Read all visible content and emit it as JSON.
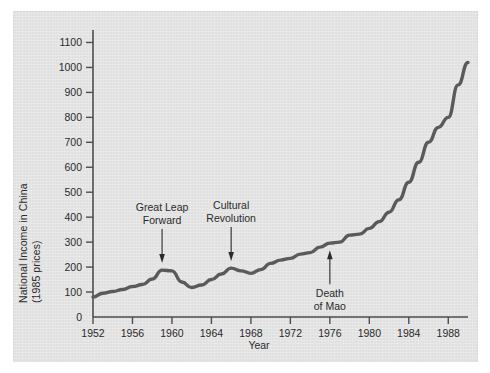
{
  "figure": {
    "background_color": "#e4e4e4",
    "line_color": "#5a5a5a",
    "axis_color": "#4d4d4d"
  },
  "chart_data": {
    "type": "line",
    "title": "",
    "xlabel": "Year",
    "ylabel_line1": "National Income in China",
    "ylabel_line2": "(1985 prices)",
    "xlim": [
      1952,
      1990
    ],
    "ylim": [
      0,
      1150
    ],
    "grid": false,
    "legend": "none",
    "xticks": [
      1952,
      1956,
      1960,
      1964,
      1968,
      1972,
      1976,
      1980,
      1984,
      1988
    ],
    "yticks": [
      0,
      100,
      200,
      300,
      400,
      500,
      600,
      700,
      800,
      900,
      1000,
      1100
    ],
    "x": [
      1952,
      1953,
      1954,
      1955,
      1956,
      1957,
      1958,
      1959,
      1960,
      1961,
      1962,
      1963,
      1964,
      1965,
      1966,
      1967,
      1968,
      1969,
      1970,
      1971,
      1972,
      1973,
      1974,
      1975,
      1976,
      1977,
      1978,
      1979,
      1980,
      1981,
      1982,
      1983,
      1984,
      1985,
      1986,
      1987,
      1988,
      1989,
      1990
    ],
    "values": [
      80,
      95,
      102,
      110,
      122,
      130,
      152,
      188,
      185,
      140,
      118,
      128,
      150,
      172,
      196,
      185,
      175,
      190,
      215,
      228,
      235,
      252,
      258,
      280,
      296,
      300,
      328,
      332,
      355,
      382,
      420,
      470,
      540,
      620,
      700,
      760,
      800,
      930,
      1020
    ],
    "series_name": "National Income in China (1985 prices)",
    "annotations": [
      {
        "id": "great-leap-forward",
        "line1": "Great Leap",
        "line2": "Forward",
        "year": 1959,
        "value": 188,
        "direction": "down"
      },
      {
        "id": "cultural-revolution",
        "line1": "Cultural",
        "line2": "Revolution",
        "year": 1966,
        "value": 196,
        "direction": "down"
      },
      {
        "id": "death-of-mao",
        "line1": "Death",
        "line2": "of Mao",
        "year": 1976,
        "value": 296,
        "direction": "up"
      }
    ]
  }
}
